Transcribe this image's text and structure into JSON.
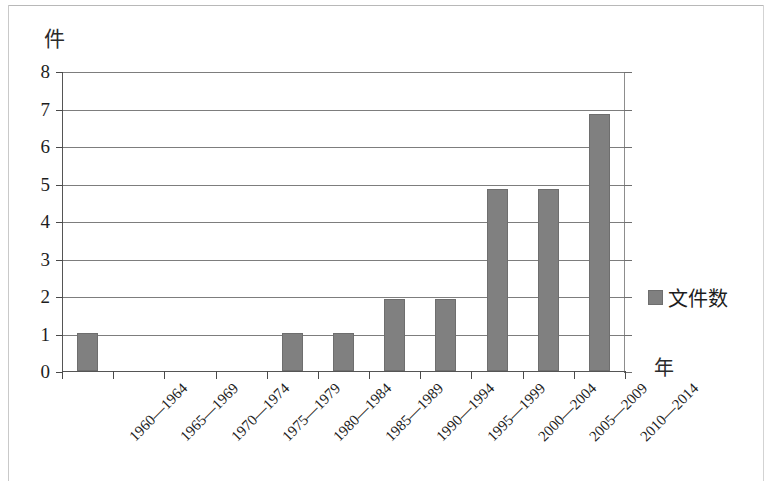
{
  "chart_data": {
    "type": "bar",
    "title": "",
    "xlabel": "年",
    "ylabel": "件",
    "ylim": [
      0,
      8
    ],
    "ytick_step": 1,
    "grid": true,
    "legend_position": "right",
    "series_name": "文件数",
    "bar_color": "#808080",
    "categories": [
      "1960—1964",
      "1965—1969",
      "1970—1974",
      "1975—1979",
      "1980—1984",
      "1985—1989",
      "1990—1994",
      "1995—1999",
      "2000—2004",
      "2005—2009",
      "2010—2014"
    ],
    "values": [
      1,
      0,
      0,
      0,
      1,
      1,
      1.92,
      1.92,
      4.85,
      4.85,
      6.85
    ],
    "ytick_labels": [
      "0",
      "1",
      "2",
      "3",
      "4",
      "5",
      "6",
      "7",
      "8"
    ]
  },
  "legend": {
    "entries": [
      {
        "label": "文件数",
        "color": "#808080",
        "swatch": "square-swatch"
      }
    ]
  }
}
